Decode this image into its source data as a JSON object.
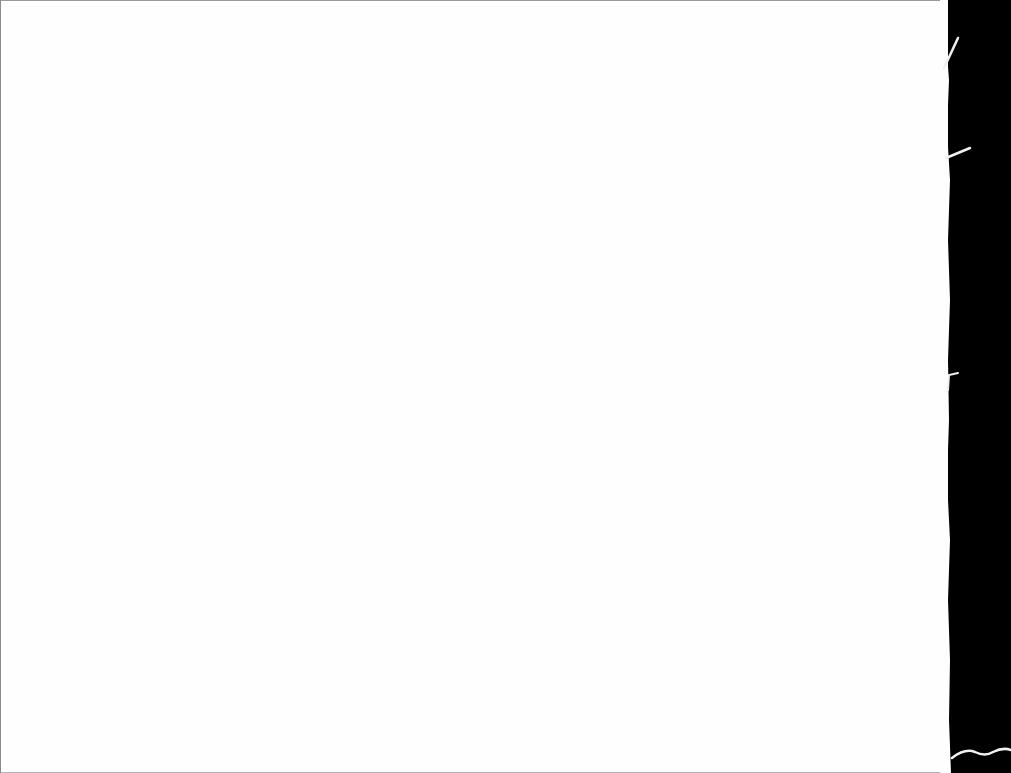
{
  "scene": {
    "description": "blank white sheet of paper photographed against a black background",
    "paper_color": "#fefefe",
    "background_color": "#000000",
    "edge_color": "#e8e8e8",
    "fiber_color": "#f2f2f2"
  }
}
